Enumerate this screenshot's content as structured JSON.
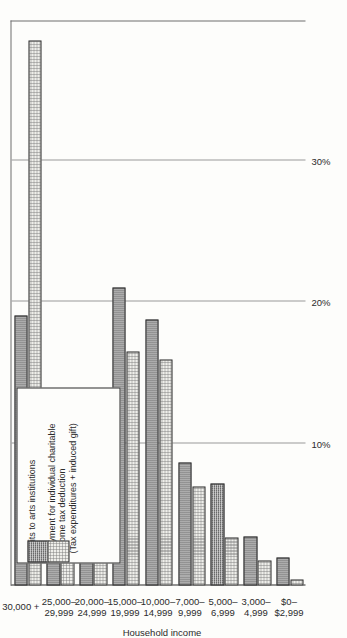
{
  "chart_data": {
    "type": "bar",
    "orientation": "horizontal",
    "title": "",
    "xlabel": "",
    "ylabel": "Household income",
    "categories": [
      "30,000 +",
      "25,000–\n29,999",
      "20,000–\n24,999",
      "15,000–\n19,999",
      "10,000–\n14,999",
      "7,000–\n9,999",
      "5,000–\n6,999",
      "3,000–\n4,999",
      "$0–\n$2,999"
    ],
    "series": [
      {
        "name": "Visits to arts institutions",
        "fill": "dark-crosshatch",
        "values": [
          19.1,
          9.8,
          13.6,
          21.1,
          18.8,
          8.7,
          7.2,
          3.5,
          2.0
        ]
      },
      {
        "name": "Payment for individual charitable income tax deduction (Tax expenditures + induced gift)",
        "fill": "light-stipple",
        "values": [
          38.6,
          7.9,
          12.4,
          16.6,
          16.0,
          7.0,
          3.4,
          1.8,
          0.4
        ]
      }
    ],
    "value_axis": {
      "ticks": [
        "10%",
        "20%",
        "30%"
      ],
      "tick_values": [
        10,
        20,
        30
      ],
      "range": [
        0,
        40
      ],
      "grid": true
    },
    "legend": {
      "position": "bottom-left",
      "entries": [
        {
          "label": "Visits to arts institutions",
          "swatch": "dark-crosshatch"
        },
        {
          "label": "Payment for individual charitable\nincome tax deduction\n(Tax expenditures + induced gift)",
          "swatch": "light-stipple"
        }
      ]
    },
    "source_note": "Source:  Table 4.3",
    "colors": {
      "dark_series": "#8d8d8d",
      "light_series": "#eeeeea",
      "axis": "#2b2b2b",
      "grid": "#9a9a9a",
      "background": "#fdfdfb"
    }
  },
  "axis_title": "Household income",
  "source": "Source:  Table 4.3"
}
